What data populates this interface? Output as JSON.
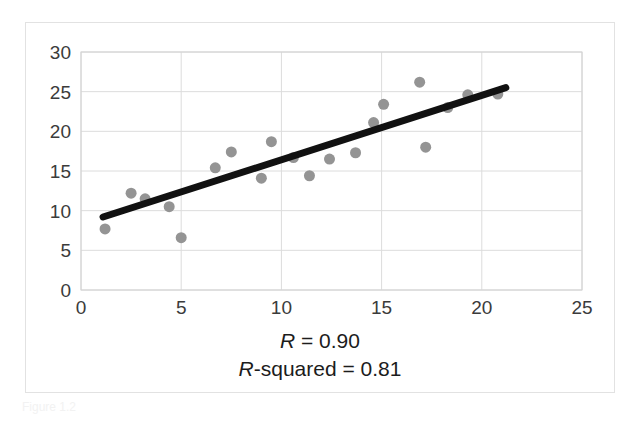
{
  "figure": {
    "background_color": "#ffffff",
    "frame_color": "#e2e2e2",
    "footer_faint_text": "Figure 1.2"
  },
  "caption": {
    "line1_symbol": "R",
    "line1_rest": " = 0.90",
    "line2_symbol": "R",
    "line2_rest": "-squared = 0.81"
  },
  "chart_data": {
    "type": "scatter",
    "title": "",
    "xlabel": "",
    "ylabel": "",
    "xlim": [
      0,
      25
    ],
    "ylim": [
      0,
      30
    ],
    "xticks": [
      0,
      5,
      10,
      15,
      20,
      25
    ],
    "yticks": [
      0,
      5,
      10,
      15,
      20,
      25,
      30
    ],
    "xtick_labels": [
      "0",
      "5",
      "10",
      "15",
      "20",
      "25"
    ],
    "ytick_labels": [
      "0",
      "5",
      "10",
      "15",
      "20",
      "25",
      "30"
    ],
    "grid": true,
    "grid_color": "#dcdcdc",
    "legend": false,
    "marker_color": "#949494",
    "marker_size": 11,
    "trendline": {
      "color": "#111111",
      "width": 7,
      "x_start": 1.1,
      "y_start": 9.2,
      "x_end": 21.2,
      "y_end": 25.5,
      "slope": 0.81,
      "intercept": 8.31
    },
    "points": [
      {
        "x": 1.2,
        "y": 7.7
      },
      {
        "x": 2.5,
        "y": 12.2
      },
      {
        "x": 3.2,
        "y": 11.5
      },
      {
        "x": 4.4,
        "y": 10.5
      },
      {
        "x": 5.0,
        "y": 6.6
      },
      {
        "x": 6.7,
        "y": 15.4
      },
      {
        "x": 7.5,
        "y": 17.4
      },
      {
        "x": 9.0,
        "y": 14.1
      },
      {
        "x": 9.5,
        "y": 18.7
      },
      {
        "x": 10.6,
        "y": 16.7
      },
      {
        "x": 11.4,
        "y": 14.4
      },
      {
        "x": 12.4,
        "y": 16.5
      },
      {
        "x": 13.7,
        "y": 17.3
      },
      {
        "x": 14.6,
        "y": 21.1
      },
      {
        "x": 15.1,
        "y": 23.4
      },
      {
        "x": 16.9,
        "y": 26.2
      },
      {
        "x": 17.2,
        "y": 18.0
      },
      {
        "x": 18.3,
        "y": 23.0
      },
      {
        "x": 19.3,
        "y": 24.6
      },
      {
        "x": 20.8,
        "y": 24.7
      }
    ],
    "annotations": [
      "R = 0.90",
      "R-squared = 0.81"
    ]
  }
}
